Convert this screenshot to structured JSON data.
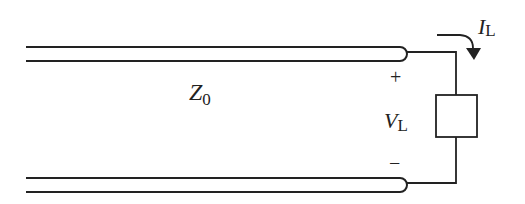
{
  "diagram": {
    "type": "transmission-line-with-load",
    "labels": {
      "impedance_main": "Z",
      "impedance_sub": "0",
      "current_main": "I",
      "current_sub": "L",
      "voltage_main": "V",
      "voltage_sub": "L",
      "plus": "+",
      "minus": "−"
    },
    "colors": {
      "stroke": "#222222",
      "background": "#ffffff"
    }
  }
}
